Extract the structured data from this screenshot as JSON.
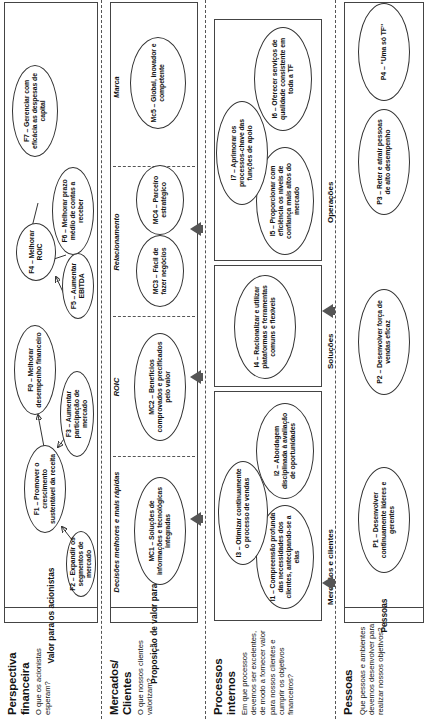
{
  "perspectives": [
    {
      "key": "financeira",
      "title": "Perspectiva financeira",
      "question": "O que os acionistas esperam?",
      "band_header": "Valor para os acionistas",
      "sections": [],
      "objectives": [
        {
          "id": "F2",
          "label": "F2 – Expandir os segmentos de mercado"
        },
        {
          "id": "F1",
          "label": "F1 – Promover o crescimento sustentável da receita"
        },
        {
          "id": "F3",
          "label": "F3 – Aumentar participação de mercado"
        },
        {
          "id": "F0",
          "label": "F0 – Melhorar desempenho financeiro"
        },
        {
          "id": "F5",
          "label": "F5 – Aumentar EBITDA"
        },
        {
          "id": "F4",
          "label": "F4 – Melhorar ROIC"
        },
        {
          "id": "F6",
          "label": "F6 – Melhorar prazo médio de contas a receber"
        },
        {
          "id": "F7",
          "label": "F7 – Gerenciar com eficácia as despesas de capital"
        }
      ]
    },
    {
      "key": "clientes",
      "title": "Mercados/ Clientes",
      "question": "O que nossos clientes valorizam?",
      "band_header": "Proposição de valor para o cliente",
      "sections": [
        {
          "label": "Decisões melhores e mais rápidas"
        },
        {
          "label": "ROIC"
        },
        {
          "label": "Relacionamento"
        },
        {
          "label": "Marca"
        }
      ],
      "objectives": [
        {
          "id": "MC1",
          "label": "MC1 – Soluções de informações e tecnológicas integradas"
        },
        {
          "id": "MC2",
          "label": "MC2 – Benefícios comprovados e precificados pelo valor"
        },
        {
          "id": "MC3",
          "label": "MC3 – Fácil de fazer negócios"
        },
        {
          "id": "MC4",
          "label": "MC4 – Parceiro estratégico"
        },
        {
          "id": "MC5",
          "label": "Mc5 – Global, inovador e competente"
        }
      ]
    },
    {
      "key": "processos",
      "title": "Processos internos",
      "question": "Em que processos devemos ser excelentes, de modo a fornecer valor para nossos clientes e cumprir os objetivos financeiros?",
      "band_header": "",
      "sections": [
        {
          "label": "Mercados e clientes"
        },
        {
          "label": "Soluções"
        },
        {
          "label": "Operações"
        }
      ],
      "objectives": [
        {
          "id": "I1",
          "label": "I1 – Compreensão profunda das necessidades dos clientes, antecipando-se a elas"
        },
        {
          "id": "I3",
          "label": "I3 – Otimizar continuamente o processo de vendas"
        },
        {
          "id": "I2",
          "label": "I2 – Abordagem disciplinada à avaliação de oportunidades"
        },
        {
          "id": "I4",
          "label": "I4 – Racionalizar e utilizar plataformas e ferramentas comuns e flexíveis"
        },
        {
          "id": "I5",
          "label": "I5 – Proporcionar com eficiência os níveis de confiança mais altos do mercado"
        },
        {
          "id": "I7",
          "label": "I7 – Aprimorar os processos-chave das funções de apoio"
        },
        {
          "id": "I6",
          "label": "I6 – Oferecer serviços de qualidade consistente em toda a TF"
        }
      ]
    },
    {
      "key": "pessoas",
      "title": "Pessoas",
      "question": "Que pessoas e ambientes devemos desenvolver para realizar nossos objetivos?",
      "band_header": "Pessoas",
      "sections": [],
      "objectives": [
        {
          "id": "P1",
          "label": "P1 – Desenvolver continuamente líderes e gerentes"
        },
        {
          "id": "P2",
          "label": "P2 – Desenvolver força de vendas eficaz"
        },
        {
          "id": "P3",
          "label": "P3 – Reter e atrair pessoas de alto desempenho"
        },
        {
          "id": "P4",
          "label": "P4 – \"Uma só TF\""
        }
      ]
    }
  ]
}
